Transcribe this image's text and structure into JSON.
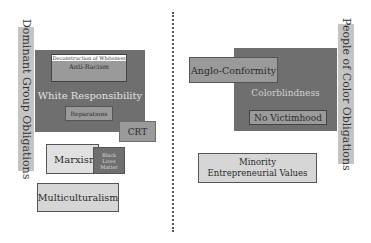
{
  "left": {
    "side_label": "Dominant Group Obligations",
    "container_label": "White Responsibility",
    "items": {
      "deconstruction": "Deconstruction of Whiteness",
      "anti_racism": "Anti-Racism",
      "reparations": "Reparations",
      "crt": "CRT",
      "marxism": "Marxism",
      "blm": "Black Lives Matter",
      "multiculturalism": "Multiculturalism"
    }
  },
  "right": {
    "side_label": "People of Color Obligations",
    "container_label": "Colorblindness",
    "items": {
      "anglo_conformity": "Anglo-Conformity",
      "no_victimhood": "No Victimhood",
      "minority_values": "Minority Entrepreneurial Values"
    }
  },
  "colors": {
    "dark_box": "#6f6f6f",
    "mid_box": "#9a9a9a",
    "light_box": "#d6d6d6",
    "side_bar": "#c4c4c4"
  }
}
